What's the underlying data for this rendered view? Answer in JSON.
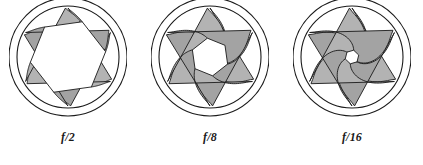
{
  "figure": {
    "background_color": "#ffffff",
    "blade_fill_color": "#b3b3b3",
    "blade_fill_color_dark": "#a3a3a3",
    "stroke_color": "#1a1a1a",
    "opening_color": "#ffffff",
    "blade_count": 6
  },
  "apertures": [
    {
      "label": "f/2",
      "name": "aperture-f2",
      "center_x": 68,
      "center_y": 66,
      "outer_radius": 59,
      "ring_radius": 51,
      "blade_outer_radius": 49,
      "opening_radius": 38,
      "blade_twist_deg": 22,
      "opening_description": "wide hexagonal opening"
    },
    {
      "label": "f/8",
      "name": "aperture-f8",
      "center_x": 210,
      "center_y": 66,
      "outer_radius": 59,
      "ring_radius": 51,
      "blade_outer_radius": 49,
      "opening_radius": 19,
      "blade_twist_deg": 52,
      "opening_description": "medium hexagonal opening"
    },
    {
      "label": "f/16",
      "name": "aperture-f16",
      "center_x": 352,
      "center_y": 66,
      "outer_radius": 59,
      "ring_radius": 51,
      "blade_outer_radius": 49,
      "opening_radius": 7,
      "blade_twist_deg": 74,
      "opening_description": "small hexagonal opening"
    }
  ],
  "caption_y": 136
}
